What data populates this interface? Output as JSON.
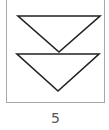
{
  "tile": {
    "icon": "double-chevron-down-triangles-icon",
    "label": "5",
    "colors": {
      "border": "#a8a8a8",
      "stroke": "#222222",
      "label": "#555555"
    }
  }
}
